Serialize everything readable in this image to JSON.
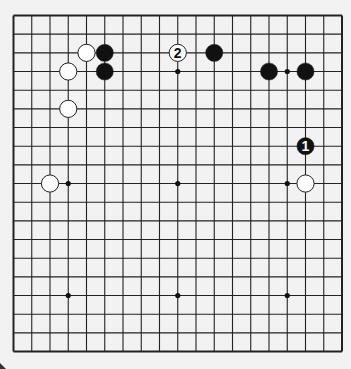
{
  "board": {
    "size": 19,
    "origin_x": 13.5,
    "origin_y": 15.5,
    "spacing_x": 18.25,
    "spacing_y": 18.67,
    "background": "#f2f2f2",
    "line_color": "#222222",
    "hoshi": [
      [
        3,
        3
      ],
      [
        9,
        3
      ],
      [
        15,
        3
      ],
      [
        3,
        9
      ],
      [
        9,
        9
      ],
      [
        15,
        9
      ],
      [
        3,
        15
      ],
      [
        9,
        15
      ],
      [
        15,
        15
      ]
    ]
  },
  "stones": [
    {
      "color": "white",
      "col": 4,
      "row": 2,
      "label": ""
    },
    {
      "color": "black",
      "col": 5,
      "row": 2,
      "label": ""
    },
    {
      "color": "white",
      "col": 3,
      "row": 3,
      "label": ""
    },
    {
      "color": "black",
      "col": 5,
      "row": 3,
      "label": ""
    },
    {
      "color": "white",
      "col": 3,
      "row": 5,
      "label": ""
    },
    {
      "color": "white",
      "col": 9,
      "row": 2,
      "label": "2"
    },
    {
      "color": "black",
      "col": 11,
      "row": 2,
      "label": ""
    },
    {
      "color": "black",
      "col": 14,
      "row": 3,
      "label": ""
    },
    {
      "color": "black",
      "col": 16,
      "row": 3,
      "label": ""
    },
    {
      "color": "black",
      "col": 16,
      "row": 7,
      "label": "1"
    },
    {
      "color": "white",
      "col": 16,
      "row": 9,
      "label": ""
    },
    {
      "color": "white",
      "col": 2,
      "row": 9,
      "label": ""
    }
  ]
}
